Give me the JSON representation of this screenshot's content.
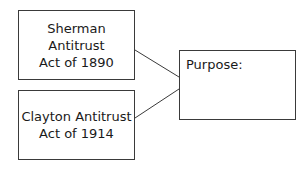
{
  "diagram": {
    "nodes": [
      {
        "id": "sherman",
        "lines": [
          "Sherman Antitrust",
          "Act of 1890"
        ]
      },
      {
        "id": "clayton",
        "lines": [
          "Clayton Antitrust",
          "Act of 1914"
        ]
      },
      {
        "id": "purpose",
        "label": "Purpose:"
      }
    ],
    "edges": [
      {
        "from": "sherman",
        "to": "purpose"
      },
      {
        "from": "clayton",
        "to": "purpose"
      }
    ],
    "colors": {
      "stroke": "#3a3a3a",
      "background": "#ffffff"
    }
  }
}
